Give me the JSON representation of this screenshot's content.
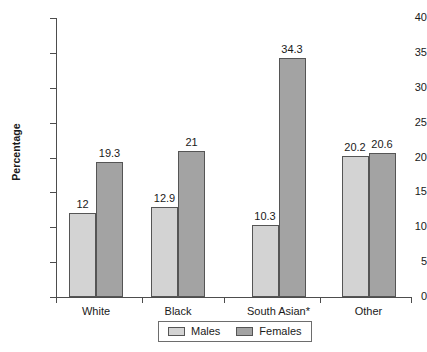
{
  "chart_data": {
    "type": "bar",
    "title": "",
    "xlabel": "",
    "ylabel": "Percentage",
    "ylim": [
      0,
      40
    ],
    "ytick_step": 5,
    "yticks": [
      0,
      5,
      10,
      15,
      20,
      25,
      30,
      35,
      40
    ],
    "ytick_labels": [
      "0",
      "5",
      "10",
      "15",
      "20",
      "25",
      "30",
      "35",
      "40"
    ],
    "grid": false,
    "legend_position": "bottom-center",
    "categories": [
      "White",
      "Black",
      "South Asian*",
      "Other"
    ],
    "series": [
      {
        "name": "Males",
        "color": "#d3d3d3",
        "values": [
          12,
          12.9,
          10.3,
          20.2
        ],
        "labels": [
          "12",
          "12.9",
          "10.3",
          "20.2"
        ]
      },
      {
        "name": "Females",
        "color": "#a3a3a3",
        "values": [
          19.3,
          21,
          34.3,
          20.6
        ],
        "labels": [
          "19.3",
          "21",
          "34.3",
          "20.6"
        ]
      }
    ],
    "legend": [
      {
        "label": "Males",
        "color": "#d3d3d3"
      },
      {
        "label": "Females",
        "color": "#a3a3a3"
      }
    ],
    "axis_color": "#4d4d4d",
    "bar_border_color": "#555555"
  }
}
